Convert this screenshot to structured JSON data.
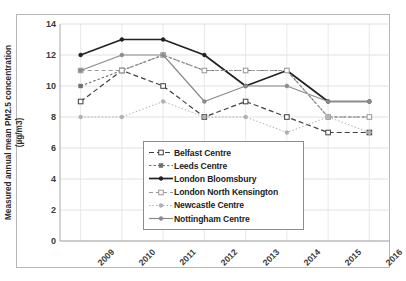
{
  "chart_data": {
    "type": "line",
    "title": "",
    "xlabel": "",
    "ylabel": "Measured annual mean PM2.5 concentration (µg/m3)",
    "ylabel_line1": "Measured annual mean PM2.5 concentration",
    "ylabel_line2": "(µg/m3)",
    "categories": [
      "2009",
      "2010",
      "2011",
      "2012",
      "2013",
      "2014",
      "2015",
      "2016"
    ],
    "x": [
      2009,
      2010,
      2011,
      2012,
      2013,
      2014,
      2015,
      2016
    ],
    "ylim": [
      0,
      14
    ],
    "yticks": [
      0,
      2,
      4,
      6,
      8,
      10,
      12,
      14
    ],
    "ytick_labels": [
      "0",
      "2",
      "4",
      "6",
      "8",
      "10",
      "12",
      "14"
    ],
    "grid": true,
    "legend_position": "center",
    "series": [
      {
        "name": "Belfast Centre",
        "values": [
          9,
          11,
          10,
          8,
          9,
          8,
          7,
          7
        ],
        "color": "#3f3f3f",
        "dash": "5,3",
        "marker": "open-square",
        "width": 1.2
      },
      {
        "name": "Leeds Centre",
        "values": [
          10,
          11,
          12,
          11,
          11,
          11,
          8,
          8
        ],
        "color": "#6e6e6e",
        "dash": "2.5,2",
        "marker": "small-square",
        "width": 1.1
      },
      {
        "name": "London Bloomsbury",
        "values": [
          12,
          13,
          13,
          12,
          10,
          11,
          9,
          9
        ],
        "color": "#222222",
        "dash": "none",
        "marker": "dot",
        "width": 1.7
      },
      {
        "name": "London North Kensington",
        "values": [
          11,
          11,
          12,
          11,
          11,
          11,
          8,
          8
        ],
        "color": "#9a9a9a",
        "dash": "4,3",
        "marker": "open-square",
        "width": 1.1
      },
      {
        "name": "Newcastle Centre",
        "values": [
          8,
          8,
          9,
          8,
          8,
          7,
          8,
          7
        ],
        "color": "#b0b0b0",
        "dash": "1.5,2",
        "marker": "dot",
        "width": 1.0
      },
      {
        "name": "Nottingham Centre",
        "values": [
          11,
          12,
          12,
          9,
          10,
          10,
          9,
          9
        ],
        "color": "#8a8a8a",
        "dash": "none",
        "marker": "dot",
        "width": 1.2
      }
    ]
  }
}
